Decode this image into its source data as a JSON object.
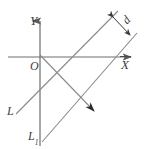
{
  "figure": {
    "background_color": "#ffffff",
    "stroke_color": "#7a7a7a",
    "axis_color": "#6e6e6e",
    "label_color": "#3d3d3d",
    "width": 147,
    "height": 149
  },
  "axes": {
    "y_axis": {
      "label": "Y",
      "name": "y-axis",
      "x": 40,
      "y_top": 18,
      "y_bottom": 146,
      "arrow": "up"
    },
    "x_axis": {
      "label": "X",
      "name": "x-axis",
      "y": 57,
      "x_left": 8,
      "x_right": 136,
      "arrow": "right",
      "has_overbar": true
    },
    "origin": {
      "label": "O",
      "x": 40,
      "y": 57
    }
  },
  "lines": [
    {
      "name": "line-L",
      "label": "L",
      "description": "first parallel line, lower-left to upper-right",
      "x1": 16,
      "y1": 114,
      "x2": 118,
      "y2": 11
    },
    {
      "name": "line-L1",
      "label": "L",
      "label_subscript": "1",
      "description": "second parallel line, lower-left to upper-right",
      "x1": 42,
      "y1": 142,
      "x2": 137,
      "y2": 33
    },
    {
      "name": "transversal-line",
      "label": "",
      "description": "descending transversal from origin with arrowhead",
      "x1": 40,
      "y1": 55,
      "x2": 97,
      "y2": 114,
      "arrow": "down-right"
    }
  ],
  "measurement": {
    "name": "distance-marker-d",
    "label": "d",
    "description": "perpendicular distance between the two parallel lines",
    "x1": 112,
    "y1": 16,
    "x2": 131,
    "y2": 36,
    "arrow": "double"
  }
}
